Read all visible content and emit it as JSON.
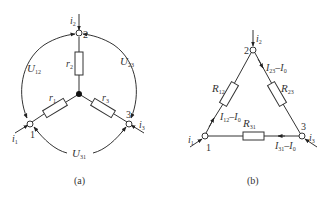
{
  "figure_a": {
    "caption": "(a)",
    "nodes": {
      "n1": "1",
      "n2": "2",
      "n3": "3"
    },
    "currents": {
      "i1": {
        "main": "i",
        "sub": "1"
      },
      "i2": {
        "main": "i",
        "sub": "2"
      },
      "i3": {
        "main": "i",
        "sub": "3"
      }
    },
    "resistors": {
      "r1": {
        "main": "r",
        "sub": "1"
      },
      "r2": {
        "main": "r",
        "sub": "2"
      },
      "r3": {
        "main": "r",
        "sub": "3"
      }
    },
    "voltages": {
      "u12": {
        "main": "U",
        "sub": "12"
      },
      "u23": {
        "main": "U",
        "sub": "23"
      },
      "u31": {
        "main": "U",
        "sub": "31"
      }
    }
  },
  "figure_b": {
    "caption": "(b)",
    "nodes": {
      "n1": "1",
      "n2": "2",
      "n3": "3"
    },
    "currents": {
      "i1": {
        "main": "i",
        "sub": "1"
      },
      "i2": {
        "main": "i",
        "sub": "2"
      },
      "i3": {
        "main": "i",
        "sub": "3"
      }
    },
    "resistors": {
      "r12": {
        "main": "R",
        "sub": "12"
      },
      "r23": {
        "main": "R",
        "sub": "23"
      },
      "r31": {
        "main": "R",
        "sub": "31"
      }
    },
    "branch_currents": {
      "i12": {
        "a": "I",
        "a_sub": "12",
        "op": "–",
        "b": "I",
        "b_sub": "0"
      },
      "i23": {
        "a": "I",
        "a_sub": "23",
        "op": "–",
        "b": "I",
        "b_sub": "0"
      },
      "i31": {
        "a": "I",
        "a_sub": "31",
        "op": "–",
        "b": "I",
        "b_sub": "0"
      }
    }
  },
  "colors": {
    "line": "#333333",
    "background": "#ffffff"
  }
}
